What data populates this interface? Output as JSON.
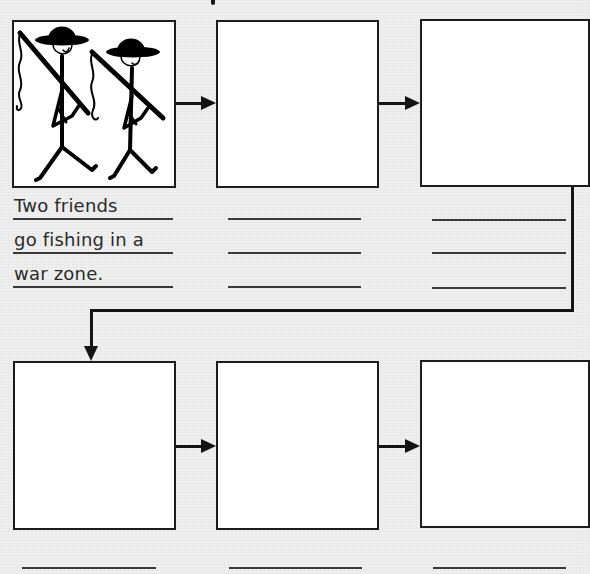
{
  "worksheet": {
    "type": "sequence-chart",
    "panels": [
      {
        "id": 1,
        "row": 1,
        "has_illustration": true,
        "illustration": "two-stick-figure-soldiers-with-fishing-rods",
        "caption_lines": [
          "Two friends",
          "go fishing in a",
          "war zone."
        ],
        "blank_lines": 3
      },
      {
        "id": 2,
        "row": 1,
        "has_illustration": false,
        "caption_lines": [],
        "blank_lines": 3
      },
      {
        "id": 3,
        "row": 1,
        "has_illustration": false,
        "caption_lines": [],
        "blank_lines": 3
      },
      {
        "id": 4,
        "row": 2,
        "has_illustration": false,
        "caption_lines": [],
        "blank_lines": 1
      },
      {
        "id": 5,
        "row": 2,
        "has_illustration": false,
        "caption_lines": [],
        "blank_lines": 1
      },
      {
        "id": 6,
        "row": 2,
        "has_illustration": false,
        "caption_lines": [],
        "blank_lines": 1
      }
    ],
    "flow": [
      {
        "from": 1,
        "to": 2,
        "icon": "arrow-right-icon"
      },
      {
        "from": 2,
        "to": 3,
        "icon": "arrow-right-icon"
      },
      {
        "from": 3,
        "to": 4,
        "icon": "elbow-arrow-down-icon"
      },
      {
        "from": 4,
        "to": 5,
        "icon": "arrow-right-icon"
      },
      {
        "from": 5,
        "to": 6,
        "icon": "arrow-right-icon"
      }
    ],
    "colors": {
      "background": "#efefef",
      "panel_fill": "#ffffff",
      "ink": "#141414",
      "rule_line": "#3a3a3a",
      "caption_text": "#2a2a2a"
    }
  }
}
